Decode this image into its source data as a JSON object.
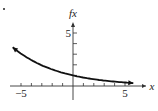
{
  "chart_data": {
    "type": "line",
    "title": "",
    "xlabel": "x",
    "ylabel": "fx",
    "xlim": [
      -6.5,
      7
    ],
    "ylim": [
      -1,
      5.5
    ],
    "x_ticks": [
      -5,
      -4,
      -3,
      -2,
      -1,
      1,
      2,
      3,
      4,
      5
    ],
    "x_tick_labels": [
      {
        "value": -5,
        "label": "−5"
      },
      {
        "value": 5,
        "label": "5"
      }
    ],
    "y_ticks": [
      1,
      2,
      3,
      4,
      5
    ],
    "y_tick_labels": [
      {
        "value": 5,
        "label": "5"
      }
    ],
    "series": [
      {
        "name": "f(x)",
        "x": [
          -5.8,
          -5,
          -4,
          -3,
          -2,
          -1,
          0,
          1,
          2,
          3,
          4,
          5,
          5.8
        ],
        "y": [
          3.65,
          3.05,
          2.44,
          1.95,
          1.56,
          1.25,
          1.0,
          0.8,
          0.64,
          0.51,
          0.41,
          0.33,
          0.27
        ],
        "arrows": "both"
      }
    ],
    "grid": false,
    "legend": null
  },
  "marker": "."
}
